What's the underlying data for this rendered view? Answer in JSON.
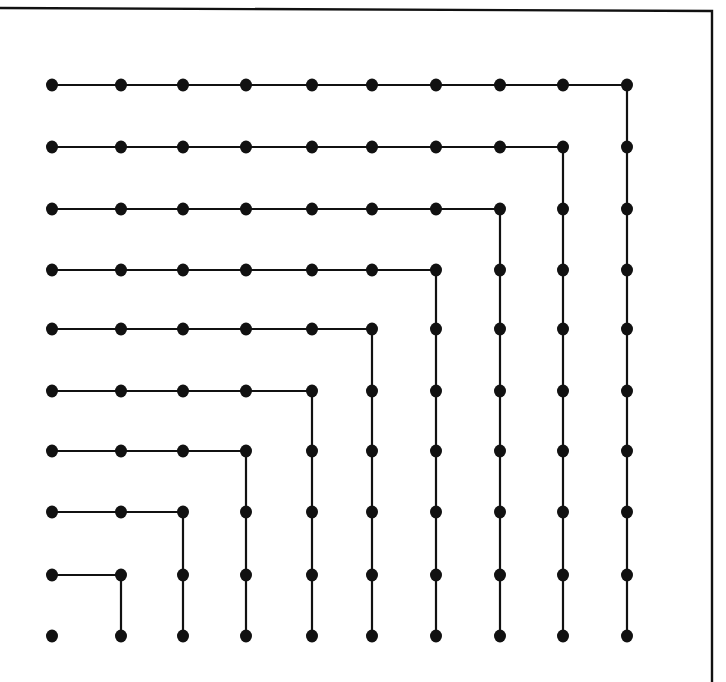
{
  "diagram": {
    "grid_size": 10,
    "columns_x": [
      52,
      121,
      183,
      246,
      312,
      372,
      436,
      500,
      563,
      627
    ],
    "rows_y": [
      85,
      147,
      209,
      270,
      329,
      391,
      451,
      512,
      575,
      636
    ],
    "dot_radius": 6,
    "line_width": 2.2,
    "stroke_color": "#111111",
    "background_color": "#ffffff",
    "frame": {
      "top_left": [
        0,
        8
      ],
      "top_right": [
        712,
        11
      ],
      "bottom_right": [
        712,
        682
      ]
    },
    "gnomons": [
      {
        "corner_col": 0,
        "dots": 1
      },
      {
        "corner_col": 1,
        "dots": 3
      },
      {
        "corner_col": 2,
        "dots": 5
      },
      {
        "corner_col": 3,
        "dots": 7
      },
      {
        "corner_col": 4,
        "dots": 9
      },
      {
        "corner_col": 5,
        "dots": 11
      },
      {
        "corner_col": 6,
        "dots": 13
      },
      {
        "corner_col": 7,
        "dots": 15
      },
      {
        "corner_col": 8,
        "dots": 17
      },
      {
        "corner_col": 9,
        "dots": 19
      }
    ]
  }
}
